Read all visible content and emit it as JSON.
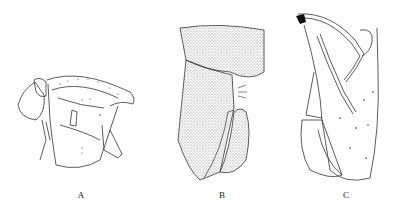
{
  "figure": {
    "panels": [
      {
        "id": "A",
        "label": "A",
        "description": "Line drawing, lateral view of head/thorax segment with appendages"
      },
      {
        "id": "B",
        "label": "B",
        "description": "Stippled drawing, terminal segment with clasping appendage"
      },
      {
        "id": "C",
        "label": "C",
        "description": "Line drawing, terminal segment with segmented antenna-like appendages"
      }
    ]
  },
  "colors": {
    "background": "#ffffff",
    "line": "#333333",
    "stipple": "#555555"
  }
}
